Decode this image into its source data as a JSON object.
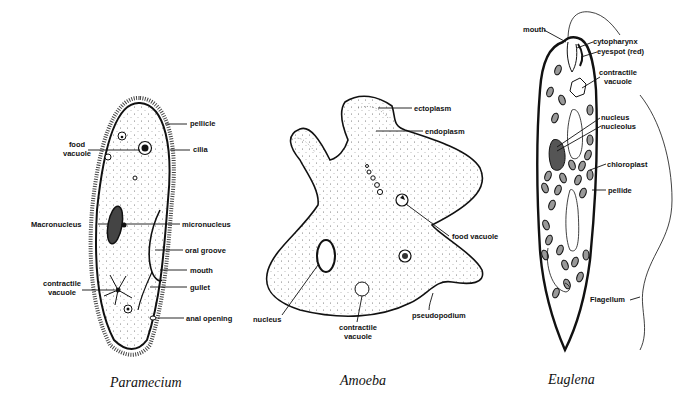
{
  "diagram": {
    "organisms": [
      {
        "name": "Paramecium",
        "labels": {
          "pellicle": "pellicle",
          "food_vacuole_1": "food",
          "food_vacuole_2": "vacuole",
          "cilia": "cilia",
          "macronucleus": "Macronucleus",
          "micronucleus": "micronucleus",
          "oral_groove": "oral groove",
          "mouth": "mouth",
          "contractile_vacuole_1": "contractile",
          "contractile_vacuole_2": "vacuole",
          "gullet": "gullet",
          "anal_opening": "anal opening"
        }
      },
      {
        "name": "Amoeba",
        "labels": {
          "ectoplasm": "ectoplasm",
          "endoplasm": "endoplasm",
          "food_vacuole": "food vacuole",
          "nucleus": "nucleus",
          "contractile_vacuole_1": "contractile",
          "contractile_vacuole_2": "vacuole",
          "pseudopodium": "pseudopodium"
        }
      },
      {
        "name": "Euglena",
        "labels": {
          "mouth": "mouth",
          "cytopharynx": "cytopharynx",
          "eyespot": "eyespot (red)",
          "contractile_vacuole_1": "contractile",
          "contractile_vacuole_2": "vacuole",
          "nucleus": "nucleus",
          "nucleolus": "nucleolus",
          "chloroplast": "chloroplast",
          "pellide": "pellide",
          "flagellum": "Flagellum"
        }
      }
    ]
  }
}
